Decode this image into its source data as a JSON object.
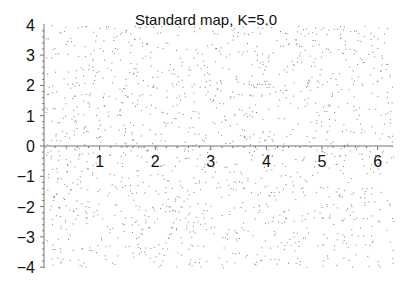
{
  "chart_data": {
    "type": "scatter",
    "title": "Standard map, K=5.0",
    "xlabel": "",
    "ylabel": "",
    "xlim": [
      0,
      6.283
    ],
    "ylim": [
      -4,
      4
    ],
    "x_ticks": [
      "1",
      "2",
      "3",
      "4",
      "5",
      "6"
    ],
    "y_ticks": [
      "-4",
      "-3",
      "-2",
      "-1",
      "0",
      "1",
      "2",
      "3",
      "4"
    ],
    "grid": false,
    "legend": null,
    "series": [
      {
        "name": "orbit points",
        "description": "Chaotic sea of ~1500 iterated points of the Chirikov standard map with K=5.0, roughly uniformly scattered over x in [0, 2π] and p in [-4, 4]",
        "marker_color": "#555555",
        "K": 5.0,
        "approx_point_count": 1500
      }
    ]
  },
  "colors": {
    "axis": "#777777",
    "text": "#111111",
    "points": "#555555"
  }
}
